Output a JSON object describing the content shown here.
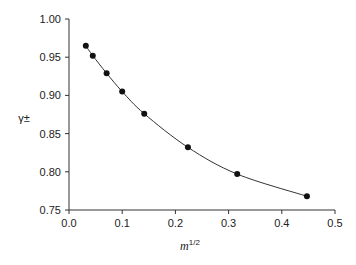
{
  "chart_data": {
    "type": "scatter",
    "title": "",
    "xlabel": "m^1/2",
    "xlabel_base": "m",
    "xlabel_superscript": "1/2",
    "ylabel": "γ±",
    "xlim": [
      0.0,
      0.5
    ],
    "ylim": [
      0.75,
      1.0
    ],
    "grid": false,
    "legend": null,
    "x_ticks": [
      "0.0",
      "0.1",
      "0.2",
      "0.3",
      "0.4",
      "0.5"
    ],
    "y_ticks": [
      "0.75",
      "0.80",
      "0.85",
      "0.90",
      "0.95",
      "1.00"
    ],
    "series": [
      {
        "name": "γ±",
        "style": "markers+smooth-line",
        "color": "#111111",
        "x": [
          0.0316,
          0.0447,
          0.0707,
          0.1,
          0.1414,
          0.2236,
          0.3162,
          0.4472
        ],
        "y": [
          0.965,
          0.952,
          0.929,
          0.905,
          0.876,
          0.832,
          0.797,
          0.768
        ]
      }
    ]
  }
}
